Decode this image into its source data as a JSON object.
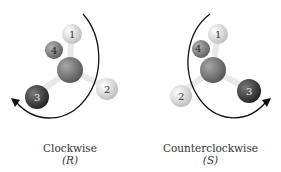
{
  "panels": [
    {
      "id": "left",
      "caption": "Clockwise",
      "config": "(R)",
      "direction": "clockwise",
      "atoms": [
        {
          "label": "1",
          "role": "top",
          "color": "#d8d8d8"
        },
        {
          "label": "2",
          "role": "right",
          "color": "#e2e2e2"
        },
        {
          "label": "3",
          "role": "left",
          "color": "#4a4a4a"
        },
        {
          "label": "4",
          "role": "back",
          "color": "#8a8a8a"
        }
      ],
      "center_color": "#7d7d7d"
    },
    {
      "id": "right",
      "caption": "Counterclockwise",
      "config": "(S)",
      "direction": "counterclockwise",
      "atoms": [
        {
          "label": "1",
          "role": "top",
          "color": "#d8d8d8"
        },
        {
          "label": "2",
          "role": "left",
          "color": "#e2e2e2"
        },
        {
          "label": "3",
          "role": "right",
          "color": "#4a4a4a"
        },
        {
          "label": "4",
          "role": "back",
          "color": "#8a8a8a"
        }
      ],
      "center_color": "#7d7d7d"
    }
  ]
}
